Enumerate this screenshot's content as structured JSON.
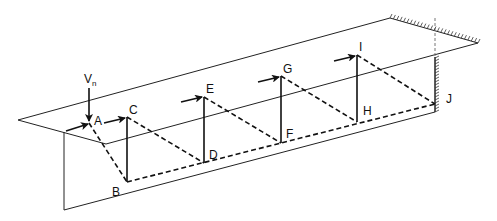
{
  "diagram": {
    "type": "strut-and-tie truss in cantilever beam",
    "load_label": "V",
    "load_subscript": "n",
    "nodes": [
      {
        "id": "A",
        "label": "A"
      },
      {
        "id": "B",
        "label": "B"
      },
      {
        "id": "C",
        "label": "C"
      },
      {
        "id": "D",
        "label": "D"
      },
      {
        "id": "E",
        "label": "E"
      },
      {
        "id": "F",
        "label": "F"
      },
      {
        "id": "G",
        "label": "G"
      },
      {
        "id": "H",
        "label": "H"
      },
      {
        "id": "I",
        "label": "I"
      },
      {
        "id": "J",
        "label": "J"
      }
    ],
    "legend": {
      "solid_vertical": "tension tie (stirrup)",
      "dashed": "compression strut",
      "arrow": "longitudinal force"
    },
    "support": "fixed wall (hatched)"
  }
}
